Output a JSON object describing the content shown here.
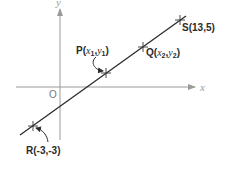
{
  "diagram": {
    "axes": {
      "x_label": "x",
      "y_label": "y",
      "origin_label": "O"
    },
    "points": {
      "R": {
        "name": "R",
        "coords": "(-3,-3)"
      },
      "P": {
        "name": "P",
        "x": "x",
        "x_sub": "1",
        "y": "y",
        "y_sub": "1"
      },
      "Q": {
        "name": "Q",
        "x": "x",
        "x_sub": "2",
        "y": "y",
        "y_sub": "2"
      },
      "S": {
        "name": "S",
        "coords": "(13,5)"
      }
    },
    "colors": {
      "axis": "#9a9a9a",
      "line": "#2b2b2b"
    }
  }
}
